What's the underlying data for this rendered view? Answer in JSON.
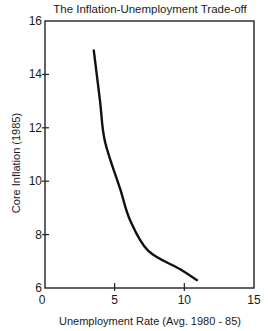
{
  "chart_data": {
    "type": "line",
    "title": "The Inflation-Unemployment Trade-off",
    "xlabel": "Unemployment Rate (Avg. 1980 - 85)",
    "ylabel": "Core Inflation (1985)",
    "xlim": [
      0,
      15
    ],
    "ylim": [
      6,
      16
    ],
    "xticks": [
      0,
      5,
      10,
      15
    ],
    "yticks": [
      6,
      8,
      10,
      12,
      14,
      16
    ],
    "grid": false,
    "legend": "none",
    "series": [
      {
        "name": "Trade-off curve",
        "color": "#111111",
        "x": [
          3.5,
          3.95,
          4.3,
          5.4,
          6.1,
          7.4,
          9.7,
          10.9
        ],
        "y": [
          14.9,
          13.0,
          11.5,
          9.7,
          8.55,
          7.4,
          6.7,
          6.3
        ]
      }
    ]
  }
}
